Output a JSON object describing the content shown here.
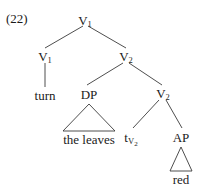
{
  "figure": {
    "example_number": "(22)",
    "type": "syntax-tree",
    "ink_color": "#1a1a1a",
    "background_color": "#ffffff"
  },
  "nodes": {
    "root": {
      "label": "V",
      "subscript": "1"
    },
    "v1_left": {
      "label": "V",
      "subscript": "1"
    },
    "v2_upper": {
      "label": "V",
      "subscript": "2"
    },
    "turn": {
      "label": "turn"
    },
    "dp": {
      "label": "DP"
    },
    "the_leaves": {
      "label": "the leaves"
    },
    "v2_lower": {
      "label": "V",
      "subscript": "2"
    },
    "trace": {
      "label": "t",
      "subscript": "V",
      "subsubscript": "2"
    },
    "ap": {
      "label": "AP"
    },
    "red": {
      "label": "red"
    }
  }
}
